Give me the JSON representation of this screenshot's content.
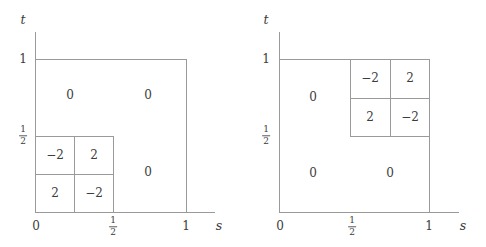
{
  "figure": {
    "type": "two-panel-diagram",
    "background": "#ffffff",
    "line_color": "#9a9a9a",
    "text_color": "#3c3c3c"
  },
  "panels": [
    {
      "id": "left",
      "axes": {
        "x_name": "s",
        "y_name": "t",
        "x_ticks": [
          {
            "label": "0",
            "frac": false
          },
          {
            "label": "1/2",
            "frac": true,
            "num": "1",
            "den": "2"
          },
          {
            "label": "1",
            "frac": false
          }
        ],
        "y_ticks": [
          {
            "label": "1/2",
            "frac": true,
            "num": "1",
            "den": "2"
          },
          {
            "label": "1",
            "frac": false
          }
        ]
      },
      "outer_square": {
        "s_from": "0",
        "s_to": "1",
        "t_from": "0",
        "t_to": "1"
      },
      "subgrid": {
        "location": "lower-left",
        "s_from": "0",
        "s_to": "1/2",
        "t_from": "0",
        "t_to": "1/2",
        "rows": [
          [
            "−2",
            "2"
          ],
          [
            "2",
            "−2"
          ]
        ]
      },
      "zero_labels": [
        "0",
        "0",
        "0"
      ]
    },
    {
      "id": "right",
      "axes": {
        "x_name": "s",
        "y_name": "t",
        "x_ticks": [
          {
            "label": "0",
            "frac": false
          },
          {
            "label": "1/2",
            "frac": true,
            "num": "1",
            "den": "2"
          },
          {
            "label": "1",
            "frac": false
          }
        ],
        "y_ticks": [
          {
            "label": "1/2",
            "frac": true,
            "num": "1",
            "den": "2"
          },
          {
            "label": "1",
            "frac": false
          }
        ]
      },
      "outer_square": {
        "s_from": "0",
        "s_to": "1",
        "t_from": "0",
        "t_to": "1"
      },
      "subgrid": {
        "location": "upper-right",
        "s_from": "1/2",
        "s_to": "1",
        "t_from": "1/2",
        "t_to": "1",
        "rows": [
          [
            "−2",
            "2"
          ],
          [
            "2",
            "−2"
          ]
        ]
      },
      "zero_labels": [
        "0",
        "0",
        "0"
      ]
    }
  ],
  "left": {
    "axis_name_t": "t",
    "axis_name_s": "s",
    "tick_y_one": "1",
    "tick_x_zero": "0",
    "tick_x_one": "1",
    "cell_tl": "−2",
    "cell_tr": "2",
    "cell_bl": "2",
    "cell_br": "−2",
    "zero_upper_left": "0",
    "zero_upper_right": "0",
    "zero_mid_right": "0",
    "frac_y_num": "1",
    "frac_y_den": "2",
    "frac_x_num": "1",
    "frac_x_den": "2"
  },
  "right": {
    "axis_name_t": "t",
    "axis_name_s": "s",
    "tick_y_one": "1",
    "tick_x_zero": "0",
    "tick_x_one": "1",
    "cell_tl": "−2",
    "cell_tr": "2",
    "cell_bl": "2",
    "cell_br": "−2",
    "zero_left_upper": "0",
    "zero_lower_left": "0",
    "zero_lower_right": "0",
    "frac_y_num": "1",
    "frac_y_den": "2",
    "frac_x_num": "1",
    "frac_x_den": "2"
  }
}
